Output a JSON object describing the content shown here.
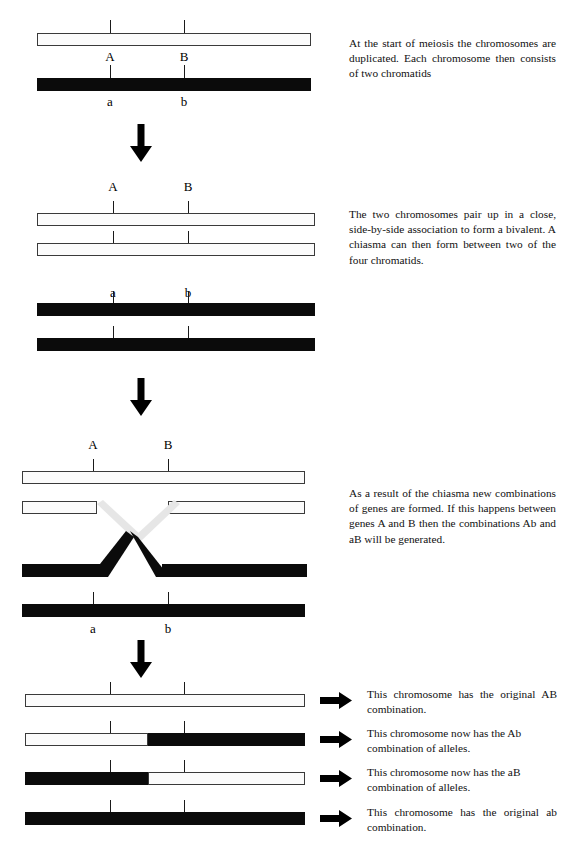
{
  "figure": {
    "colors": {
      "chromatid_white_fill": "#fbfbfb",
      "chromatid_white_outline": "#3a3a3a",
      "chromatid_black_fill": "#0b0b0b",
      "arrow_fill": "#000000",
      "crossover_pale_strand": "#e2e2e2",
      "background": "#ffffff"
    }
  },
  "stages": [
    {
      "id": "stage-1-duplication",
      "caption": "At the start of meiosis the chromosomes are duplicated. Each chromosome then consists of two chromatids",
      "gene_labels_upper": [
        "A",
        "B"
      ],
      "gene_labels_lower": [
        "a",
        "b"
      ],
      "chromatids": [
        {
          "name": "maternal-chromatid",
          "fill": "white"
        },
        {
          "name": "paternal-chromatid",
          "fill": "black"
        }
      ]
    },
    {
      "id": "stage-2-bivalent",
      "caption": "The two chromosomes pair up in a close, side-by-side association to form a bivalent. A chiasma can then form between two of the four chromatids.",
      "gene_labels_upper": [
        "A",
        "B"
      ],
      "gene_labels_lower": [
        "a",
        "b"
      ],
      "chromatids": [
        {
          "name": "white-chromatid-1",
          "fill": "white"
        },
        {
          "name": "white-chromatid-2",
          "fill": "white"
        },
        {
          "name": "black-chromatid-1",
          "fill": "black"
        },
        {
          "name": "black-chromatid-2",
          "fill": "black"
        }
      ]
    },
    {
      "id": "stage-3-chiasma",
      "caption": "As a result of the chiasma new combinations of genes are formed. If this happens between genes A and B then the combinations Ab and aB will be generated.",
      "gene_labels_upper": [
        "A",
        "B"
      ],
      "gene_labels_lower": [
        "a",
        "b"
      ],
      "chromatids": [
        {
          "name": "white-chromatid-uncrossed",
          "fill": "white"
        },
        {
          "name": "white-chromatid-crossed",
          "fill": "white"
        },
        {
          "name": "black-chromatid-crossed",
          "fill": "black"
        },
        {
          "name": "black-chromatid-uncrossed",
          "fill": "black"
        }
      ]
    }
  ],
  "products": [
    {
      "id": "product-AB",
      "segments": [
        {
          "fill": "white",
          "fraction": 1.0
        }
      ],
      "caption": "This chromosome has the original AB combination."
    },
    {
      "id": "product-Ab",
      "segments": [
        {
          "fill": "white",
          "fraction": 0.44
        },
        {
          "fill": "black",
          "fraction": 0.56
        }
      ],
      "caption": "This chromosome now has the Ab combination of alleles."
    },
    {
      "id": "product-aB",
      "segments": [
        {
          "fill": "black",
          "fraction": 0.44
        },
        {
          "fill": "white",
          "fraction": 0.56
        }
      ],
      "caption": "This chromosome now has the aB combination of alleles."
    },
    {
      "id": "product-ab",
      "segments": [
        {
          "fill": "black",
          "fraction": 1.0
        }
      ],
      "caption": "This chromosome has the original ab combination."
    }
  ],
  "icons": {
    "down_arrow": "down-arrow-icon",
    "right_arrow": "right-arrow-icon"
  }
}
